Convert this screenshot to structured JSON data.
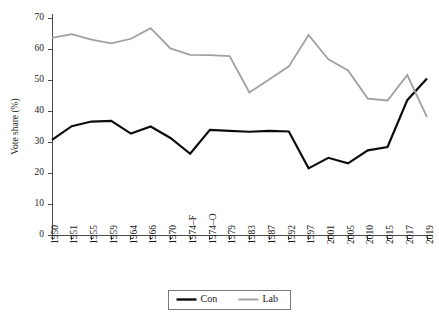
{
  "chart_data": {
    "type": "line",
    "title": "",
    "xlabel": "",
    "ylabel": "Vote share (%)",
    "ylim": [
      0,
      70
    ],
    "yticks": [
      0,
      10,
      20,
      30,
      40,
      50,
      60,
      70
    ],
    "grid": false,
    "legend_position": "bottom-center",
    "categories": [
      "1950",
      "1951",
      "1955",
      "1959",
      "1964",
      "1966",
      "1970",
      "1974–F",
      "1974–O",
      "1979",
      "1983",
      "1987",
      "1992",
      "1997",
      "2001",
      "2005",
      "2010",
      "2015",
      "2017",
      "2019"
    ],
    "series": [
      {
        "name": "Con",
        "color": "#0d0d0d",
        "values": [
          30.7,
          35.1,
          36.6,
          36.8,
          32.7,
          35.0,
          31.3,
          26.2,
          33.9,
          33.6,
          33.3,
          33.6,
          33.4,
          21.5,
          24.9,
          23.1,
          27.3,
          28.4,
          43.5,
          50.5
        ]
      },
      {
        "name": "Lab",
        "color": "#a0a0a0",
        "values": [
          63.6,
          64.8,
          63.0,
          61.8,
          63.3,
          66.7,
          60.2,
          58.1,
          58.0,
          57.7,
          46.0,
          50.2,
          54.4,
          64.5,
          56.7,
          53.1,
          44.0,
          43.4,
          51.6,
          38.0
        ]
      }
    ]
  },
  "legend": {
    "entries": [
      {
        "label": "Con"
      },
      {
        "label": "Lab"
      }
    ]
  }
}
